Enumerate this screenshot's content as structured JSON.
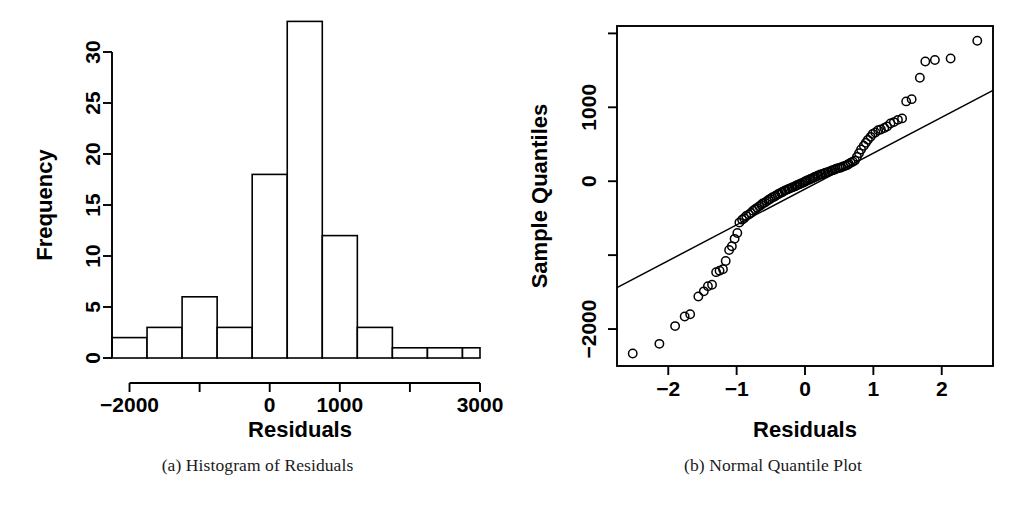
{
  "figure": {
    "background_color": "#ffffff",
    "foreground_color": "#000000"
  },
  "captions": {
    "a": "(a) Histogram of Residuals",
    "b": "(b) Normal Quantile Plot"
  },
  "chart_data": [
    {
      "id": "histogram-of-residuals",
      "type": "bar",
      "title": "",
      "xlabel": "Residuals",
      "ylabel": "Frequency",
      "xlim": [
        -2250,
        3000
      ],
      "ylim": [
        0,
        33
      ],
      "grid": false,
      "legend": null,
      "bin_width": 500,
      "bin_edges": [
        -2250,
        -1750,
        -1250,
        -750,
        -250,
        250,
        750,
        1250,
        1750,
        2250,
        2750,
        3000
      ],
      "categories": [
        "-2250 to -1750",
        "-1750 to -1250",
        "-1250 to -750",
        "-750 to -250",
        "-250 to 250",
        "250 to 750",
        "750 to 1250",
        "1250 to 1750",
        "1750 to 2250",
        "2250 to 2750",
        "2750 to 3000"
      ],
      "values": [
        2,
        3,
        6,
        3,
        18,
        33,
        12,
        3,
        1,
        1,
        1
      ],
      "xticks": [
        -2000,
        -1000,
        0,
        1000,
        2000,
        3000
      ],
      "xtick_labels": [
        "-2000",
        "",
        "0",
        "1000",
        "",
        "3000"
      ],
      "yticks": [
        0,
        5,
        10,
        15,
        20,
        25,
        30
      ],
      "ytick_labels": [
        "0",
        "5",
        "10",
        "15",
        "20",
        "25",
        "30"
      ]
    },
    {
      "id": "normal-quantile-plot",
      "type": "scatter",
      "title": "",
      "xlabel": "Residuals",
      "ylabel": "Sample Quantiles",
      "xlim": [
        -2.75,
        2.75
      ],
      "ylim": [
        -2500,
        2100
      ],
      "grid": false,
      "legend": null,
      "xticks": [
        -2,
        -1,
        0,
        1,
        2
      ],
      "xtick_labels": [
        "-2",
        "-1",
        "0",
        "1",
        "2"
      ],
      "yticks": [
        -2000,
        -1000,
        0,
        1000,
        2000
      ],
      "ytick_labels": [
        "-2000",
        "",
        "0",
        "1000",
        ""
      ],
      "reference_line": {
        "name": "qq-reference-line",
        "x": [
          -2.75,
          2.75
        ],
        "y": [
          -1440,
          1230
        ]
      },
      "x": [
        -2.52,
        -2.13,
        -1.9,
        -1.76,
        -1.68,
        -1.56,
        -1.48,
        -1.42,
        -1.36,
        -1.3,
        -1.25,
        -1.2,
        -1.16,
        -1.11,
        -1.07,
        -1.03,
        -0.99,
        -0.96,
        -0.92,
        -0.89,
        -0.86,
        -0.82,
        -0.79,
        -0.76,
        -0.73,
        -0.7,
        -0.67,
        -0.64,
        -0.62,
        -0.59,
        -0.56,
        -0.53,
        -0.51,
        -0.48,
        -0.45,
        -0.43,
        -0.4,
        -0.38,
        -0.35,
        -0.33,
        -0.3,
        -0.28,
        -0.25,
        -0.23,
        -0.2,
        -0.18,
        -0.15,
        -0.13,
        -0.11,
        -0.08,
        -0.06,
        -0.03,
        -0.01,
        0.01,
        0.03,
        0.06,
        0.08,
        0.11,
        0.13,
        0.15,
        0.18,
        0.2,
        0.23,
        0.25,
        0.28,
        0.3,
        0.33,
        0.35,
        0.38,
        0.4,
        0.43,
        0.45,
        0.48,
        0.51,
        0.53,
        0.56,
        0.59,
        0.62,
        0.64,
        0.67,
        0.7,
        0.73,
        0.76,
        0.79,
        0.82,
        0.86,
        0.89,
        0.92,
        0.96,
        0.99,
        1.03,
        1.07,
        1.11,
        1.16,
        1.2,
        1.25,
        1.3,
        1.36,
        1.42,
        1.48,
        1.56,
        1.68,
        1.76,
        1.9,
        2.13,
        2.52
      ],
      "y": [
        -2330,
        -2200,
        -1960,
        -1830,
        -1800,
        -1560,
        -1490,
        -1420,
        -1400,
        -1230,
        -1210,
        -1190,
        -1080,
        -930,
        -880,
        -780,
        -700,
        -560,
        -520,
        -500,
        -470,
        -450,
        -430,
        -400,
        -380,
        -360,
        -340,
        -320,
        -300,
        -290,
        -270,
        -250,
        -240,
        -220,
        -210,
        -195,
        -180,
        -170,
        -155,
        -145,
        -130,
        -120,
        -110,
        -100,
        -90,
        -80,
        -70,
        -60,
        -50,
        -40,
        -30,
        -20,
        -10,
        0,
        10,
        20,
        30,
        40,
        50,
        60,
        70,
        80,
        90,
        95,
        105,
        115,
        120,
        130,
        140,
        150,
        155,
        165,
        175,
        180,
        190,
        200,
        210,
        220,
        235,
        250,
        265,
        280,
        330,
        380,
        430,
        480,
        520,
        560,
        600,
        640,
        660,
        690,
        700,
        720,
        740,
        780,
        800,
        830,
        850,
        1080,
        1110,
        1400,
        1620,
        1640,
        1660,
        1900
      ]
    }
  ]
}
